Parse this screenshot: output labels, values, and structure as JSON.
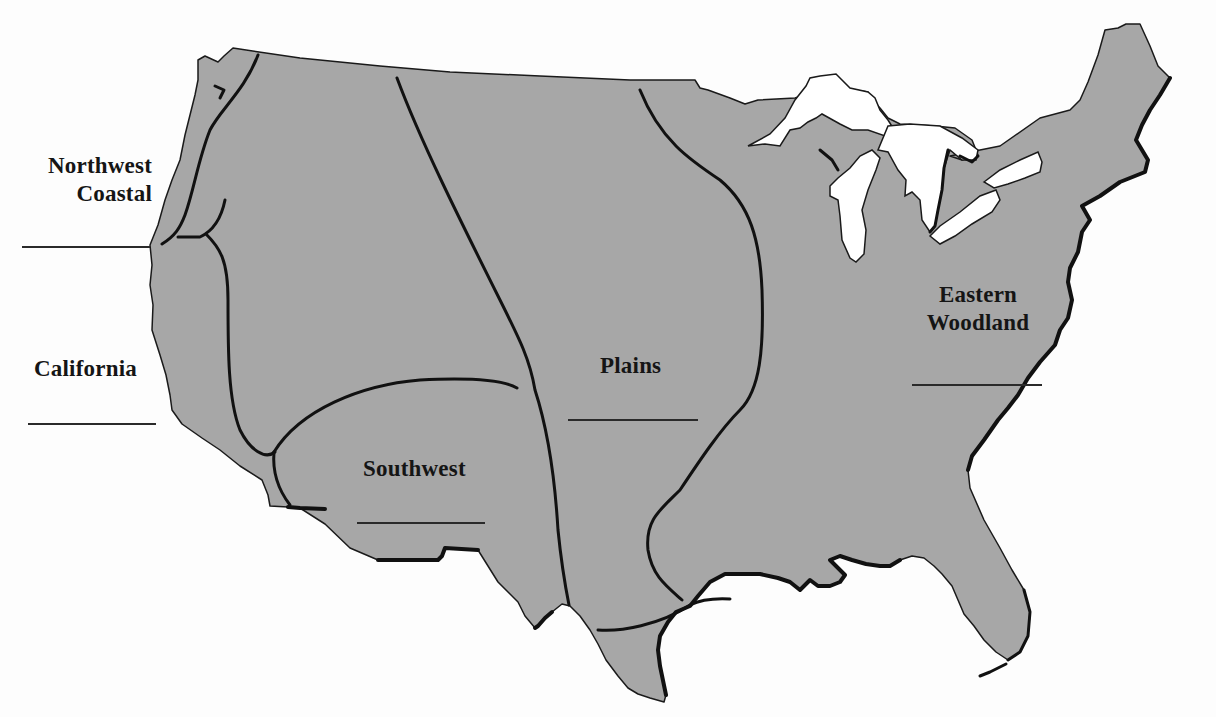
{
  "map": {
    "subject": "Native American culture areas of the United States",
    "land_color": "#a7a7a7",
    "water_color": "#ffffff",
    "boundary_color": "#111111",
    "regions": [
      {
        "id": "northwest-coastal",
        "label_line1": "Northwest",
        "label_line2": "Coastal",
        "has_answer_blank": true
      },
      {
        "id": "california",
        "label_line1": "California",
        "has_answer_blank": true
      },
      {
        "id": "southwest",
        "label_line1": "Southwest",
        "has_answer_blank": true
      },
      {
        "id": "plains",
        "label_line1": "Plains",
        "has_answer_blank": true
      },
      {
        "id": "eastern-woodland",
        "label_line1": "Eastern",
        "label_line2": "Woodland",
        "has_answer_blank": true
      }
    ]
  }
}
